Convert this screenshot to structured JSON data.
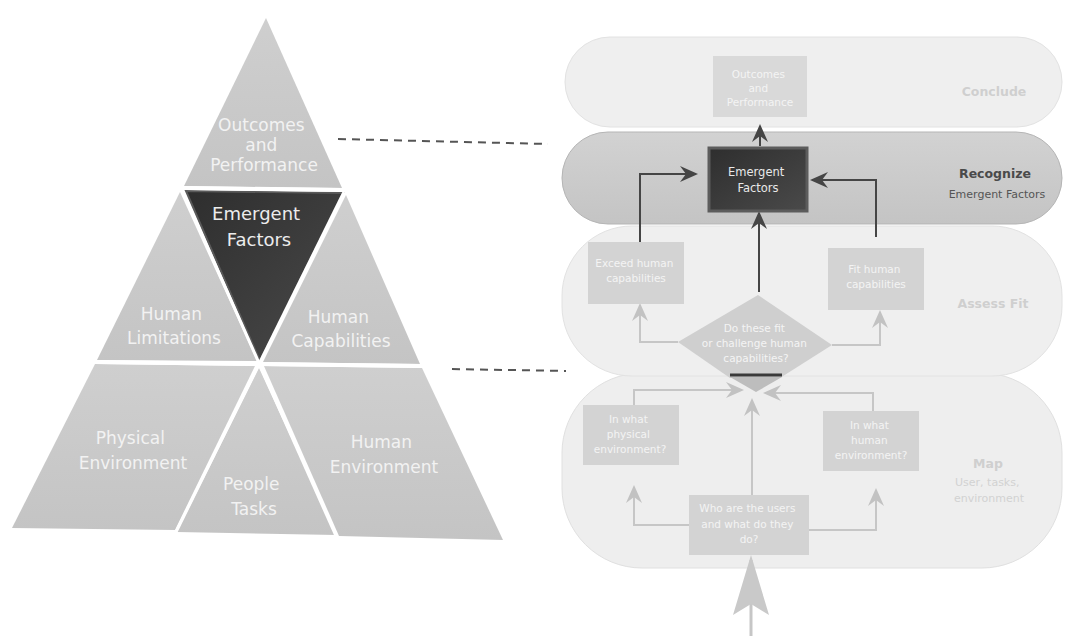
{
  "pyramid": {
    "segments": {
      "outcomes": [
        "Outcomes",
        "and",
        "Performance"
      ],
      "emergent": [
        "Emergent",
        "Factors"
      ],
      "limitations": [
        "Human",
        "Limitations"
      ],
      "capabilities": [
        "Human",
        "Capabilities"
      ],
      "physical_env": [
        "Physical",
        "Environment"
      ],
      "people_tasks": [
        "People",
        "Tasks"
      ],
      "human_env": [
        "Human",
        "Environment"
      ]
    }
  },
  "flow": {
    "lanes": {
      "conclude": {
        "title": "Conclude",
        "subtitle": ""
      },
      "recognize": {
        "title": "Recognize",
        "subtitle": "Emergent Factors"
      },
      "assess": {
        "title": "Assess Fit",
        "subtitle": ""
      },
      "map": {
        "title": "Map",
        "subtitle": [
          "User, tasks,",
          "environment"
        ]
      }
    },
    "nodes": {
      "outcomes": [
        "Outcomes",
        "and",
        "Performance"
      ],
      "emergent": [
        "Emergent",
        "Factors"
      ],
      "exceed": [
        "Exceed human",
        "capabilities"
      ],
      "fit": [
        "Fit human",
        "capabilities"
      ],
      "decision": [
        "Do these fit",
        "or challenge human",
        "capabilities?"
      ],
      "physical": [
        "In what",
        "physical",
        "environment?"
      ],
      "human": [
        "In what",
        "human",
        "environment?"
      ],
      "users": [
        "Who are the users",
        "and what do they",
        "do?"
      ]
    }
  },
  "colors": {
    "pyramid_fill": "#c9c9c9",
    "pyramid_dark": "#3a3a3a",
    "lane_light": "#ededed",
    "lane_recognize": "#cdcdcd",
    "box_light": "#d4d4d4",
    "box_dark": "#353535",
    "arrow_dark": "#4a4a4a",
    "arrow_light": "#c8c8c8"
  }
}
